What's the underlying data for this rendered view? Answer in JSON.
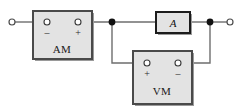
{
  "diagram": {
    "type": "schematic",
    "background_color": "#ffffff",
    "wire_color": "#6e6e6e",
    "box_fill_color": "#e3e3e3",
    "box_border_color": "#4a4a4a",
    "dark_border_color": "#1c1c1c",
    "node_color": "#111111",
    "terminal_fill_color": "#ffffff"
  },
  "components": {
    "ammeter": {
      "label": "AM",
      "name": "ammeter",
      "left_terminal_sign": "–",
      "right_terminal_sign": "+",
      "x": 33,
      "y": 11,
      "width": 59,
      "height": 48
    },
    "voltmeter": {
      "label": "VM",
      "name": "voltmeter",
      "left_terminal_sign": "+",
      "right_terminal_sign": "–",
      "x": 133,
      "y": 51,
      "width": 59,
      "height": 53
    },
    "load": {
      "label": "A",
      "name": "load-element",
      "x": 156,
      "y": 12,
      "width": 34,
      "height": 21
    }
  },
  "terminals": {
    "left_open_terminal": {
      "name": "left-input-terminal",
      "cx": 12,
      "cy": 22,
      "r": 3
    },
    "right_open_terminal": {
      "name": "right-output-terminal",
      "cx": 230,
      "cy": 22,
      "r": 3
    },
    "ammeter_minus": {
      "cx": 47,
      "cy": 22,
      "r": 3
    },
    "ammeter_plus": {
      "cx": 78,
      "cy": 22,
      "r": 3
    },
    "voltmeter_plus": {
      "cx": 147,
      "cy": 63,
      "r": 3
    },
    "voltmeter_minus": {
      "cx": 178,
      "cy": 63,
      "r": 3
    }
  },
  "junctions": {
    "left_node": {
      "name": "left-junction-node",
      "cx": 112,
      "cy": 22,
      "r": 3.4
    },
    "right_node": {
      "name": "right-junction-node",
      "cx": 210,
      "cy": 22,
      "r": 3.4
    }
  },
  "wires": [
    {
      "name": "wire-left-input-to-ammeter",
      "d": "M 15 22 L 47 22"
    },
    {
      "name": "wire-ammeter-to-left-node",
      "d": "M 78 22 L 112 22"
    },
    {
      "name": "wire-left-node-to-load",
      "d": "M 112 22 L 156 22"
    },
    {
      "name": "wire-load-to-right-node",
      "d": "M 190 22 L 210 22"
    },
    {
      "name": "wire-right-node-to-output",
      "d": "M 210 22 L 227 22"
    },
    {
      "name": "wire-left-node-down-to-voltmeter-plus",
      "d": "M 112 22 L 112 63 L 147 63"
    },
    {
      "name": "wire-right-node-down-to-voltmeter-minus",
      "d": "M 210 22 L 210 63 L 178 63"
    }
  ]
}
